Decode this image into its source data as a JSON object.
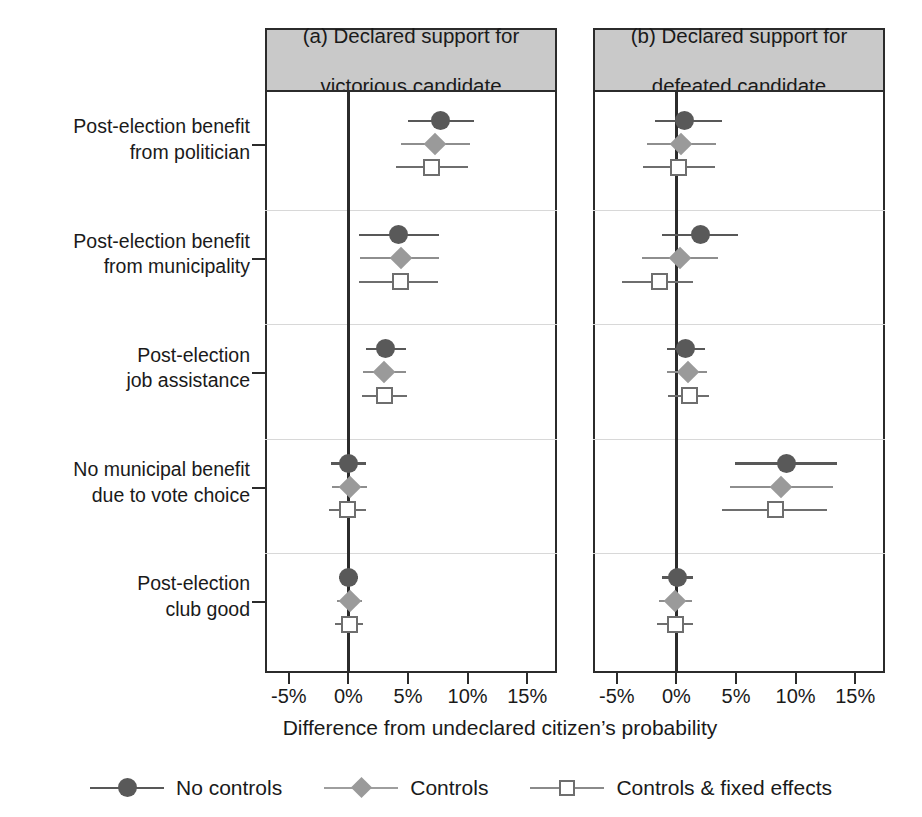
{
  "chart_data": {
    "type": "scatter",
    "title": "",
    "xlabel": "Difference from undeclared citizen’s probability",
    "ylabel": "",
    "xlim": [
      -7.0,
      17.5
    ],
    "xticks": [
      -5,
      0,
      5,
      10,
      15
    ],
    "xticklabels": [
      "-5%",
      "0%",
      "5%",
      "10%",
      "15%"
    ],
    "grid": false,
    "legend_position": "bottom",
    "reference_line": 0,
    "panels": [
      {
        "id": "a",
        "title_lines": [
          "(a) Declared support for",
          "victorious candidate"
        ]
      },
      {
        "id": "b",
        "title_lines": [
          "(b) Declared support for",
          "defeated candidate"
        ]
      }
    ],
    "categories": [
      "Post-election benefit from politician",
      "Post-election benefit from municipality",
      "Post-election job assistance",
      "No municipal benefit due to vote choice",
      "Post-election club good"
    ],
    "category_label_lines": [
      [
        "Post-election benefit",
        "from politician"
      ],
      [
        "Post-election benefit",
        "from municipality"
      ],
      [
        "Post-election",
        "job assistance"
      ],
      [
        "No municipal benefit",
        "due to vote choice"
      ],
      [
        "Post-election",
        "club good"
      ]
    ],
    "series": [
      {
        "name": "No controls",
        "marker": "circle",
        "color": "#595959"
      },
      {
        "name": "Controls",
        "marker": "diamond",
        "color": "#9a9a9a"
      },
      {
        "name": "Controls & fixed effects",
        "marker": "square",
        "color": "#6e6e6e"
      }
    ],
    "panel_a_estimates": [
      {
        "category": "Post-election benefit from politician",
        "points": [
          {
            "series": "No controls",
            "estimate": 7.7,
            "ci_low": 5.0,
            "ci_high": 10.5
          },
          {
            "series": "Controls",
            "estimate": 7.3,
            "ci_low": 4.4,
            "ci_high": 10.2
          },
          {
            "series": "Controls & fixed effects",
            "estimate": 7.0,
            "ci_low": 4.0,
            "ci_high": 10.0
          }
        ]
      },
      {
        "category": "Post-election benefit from municipality",
        "points": [
          {
            "series": "No controls",
            "estimate": 4.2,
            "ci_low": 0.9,
            "ci_high": 7.6
          },
          {
            "series": "Controls",
            "estimate": 4.4,
            "ci_low": 1.0,
            "ci_high": 7.6
          },
          {
            "series": "Controls & fixed effects",
            "estimate": 4.4,
            "ci_low": 0.9,
            "ci_high": 7.5
          }
        ]
      },
      {
        "category": "Post-election job assistance",
        "points": [
          {
            "series": "No controls",
            "estimate": 3.1,
            "ci_low": 1.5,
            "ci_high": 4.8
          },
          {
            "series": "Controls",
            "estimate": 3.0,
            "ci_low": 1.2,
            "ci_high": 4.8
          },
          {
            "series": "Controls & fixed effects",
            "estimate": 3.0,
            "ci_low": 1.1,
            "ci_high": 4.9
          }
        ]
      },
      {
        "category": "No municipal benefit due to vote choice",
        "points": [
          {
            "series": "No controls",
            "estimate": 0.0,
            "ci_low": -1.5,
            "ci_high": 1.5
          },
          {
            "series": "Controls",
            "estimate": 0.1,
            "ci_low": -1.4,
            "ci_high": 1.6
          },
          {
            "series": "Controls & fixed effects",
            "estimate": -0.1,
            "ci_low": -1.6,
            "ci_high": 1.5
          }
        ]
      },
      {
        "category": "Post-election club good",
        "points": [
          {
            "series": "No controls",
            "estimate": 0.0,
            "ci_low": -0.8,
            "ci_high": 0.8
          },
          {
            "series": "Controls",
            "estimate": 0.1,
            "ci_low": -1.0,
            "ci_high": 1.1
          },
          {
            "series": "Controls & fixed effects",
            "estimate": 0.1,
            "ci_low": -1.1,
            "ci_high": 1.2
          }
        ]
      }
    ],
    "panel_b_estimates": [
      {
        "category": "Post-election benefit from politician",
        "points": [
          {
            "series": "No controls",
            "estimate": 0.7,
            "ci_low": -1.8,
            "ci_high": 3.8
          },
          {
            "series": "Controls",
            "estimate": 0.4,
            "ci_low": -2.5,
            "ci_high": 3.3
          },
          {
            "series": "Controls & fixed effects",
            "estimate": 0.2,
            "ci_low": -2.8,
            "ci_high": 3.2
          }
        ]
      },
      {
        "category": "Post-election benefit from municipality",
        "points": [
          {
            "series": "No controls",
            "estimate": 2.0,
            "ci_low": -1.2,
            "ci_high": 5.2
          },
          {
            "series": "Controls",
            "estimate": 0.3,
            "ci_low": -2.9,
            "ci_high": 3.5
          },
          {
            "series": "Controls & fixed effects",
            "estimate": -1.4,
            "ci_low": -4.6,
            "ci_high": 1.4
          }
        ]
      },
      {
        "category": "Post-election job assistance",
        "points": [
          {
            "series": "No controls",
            "estimate": 0.8,
            "ci_low": -0.8,
            "ci_high": 2.4
          },
          {
            "series": "Controls",
            "estimate": 1.0,
            "ci_low": -0.8,
            "ci_high": 2.6
          },
          {
            "series": "Controls & fixed effects",
            "estimate": 1.1,
            "ci_low": -0.7,
            "ci_high": 2.7
          }
        ]
      },
      {
        "category": "No municipal benefit due to vote choice",
        "points": [
          {
            "series": "No controls",
            "estimate": 9.2,
            "ci_low": 4.9,
            "ci_high": 13.5
          },
          {
            "series": "Controls",
            "estimate": 8.8,
            "ci_low": 4.5,
            "ci_high": 13.1
          },
          {
            "series": "Controls & fixed effects",
            "estimate": 8.3,
            "ci_low": 3.8,
            "ci_high": 12.6
          }
        ]
      },
      {
        "category": "Post-election club good",
        "points": [
          {
            "series": "No controls",
            "estimate": 0.1,
            "ci_low": -1.2,
            "ci_high": 1.4
          },
          {
            "series": "Controls",
            "estimate": -0.1,
            "ci_low": -1.5,
            "ci_high": 1.3
          },
          {
            "series": "Controls & fixed effects",
            "estimate": -0.1,
            "ci_low": -1.6,
            "ci_high": 1.4
          }
        ]
      }
    ]
  },
  "colors": {
    "panel_title_bg": "#c9c9c9",
    "frame": "#2b2b2b",
    "series_no_controls": "#595959",
    "series_controls": "#9a9a9a",
    "series_controls_fe": "#6e6e6e"
  }
}
